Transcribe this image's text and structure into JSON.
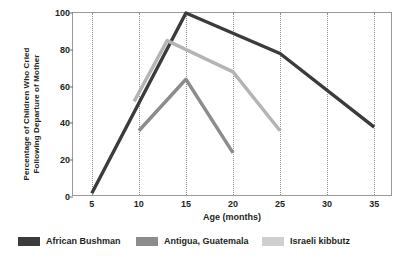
{
  "chart_data": {
    "type": "line",
    "title": "",
    "xlabel": "Age (months)",
    "ylabel": "Percentage of Children Who Cried Following Departure of Mother",
    "ylabel_line1": "Percentage of Children Who Cried",
    "ylabel_line2": "Following Departure of Mother",
    "xlim": [
      3,
      37
    ],
    "ylim": [
      0,
      100
    ],
    "xticks": [
      5,
      10,
      15,
      20,
      25,
      30,
      35
    ],
    "yticks": [
      0,
      20,
      40,
      60,
      80,
      100
    ],
    "grid": "vertical-dotted",
    "legend_position": "bottom",
    "series": [
      {
        "name": "African Bushman",
        "color": "#3b3b3b",
        "x": [
          5,
          15,
          25,
          35
        ],
        "values": [
          2,
          100,
          78,
          38
        ]
      },
      {
        "name": "Antigua, Guatemala",
        "color": "#8c8c8c",
        "x": [
          10,
          15,
          20
        ],
        "values": [
          36,
          64,
          24
        ]
      },
      {
        "name": "Israeli kibbutz",
        "color": "#b4b4b4",
        "x": [
          9.5,
          13,
          20,
          25
        ],
        "values": [
          52,
          85,
          68,
          36
        ]
      }
    ]
  },
  "legend": {
    "items": [
      {
        "label": "African Bushman",
        "color": "#3b3b3b"
      },
      {
        "label": "Antigua, Guatemala",
        "color": "#8c8c8c"
      },
      {
        "label": "Israeli kibbutz",
        "color": "#cfcfcf"
      }
    ]
  }
}
